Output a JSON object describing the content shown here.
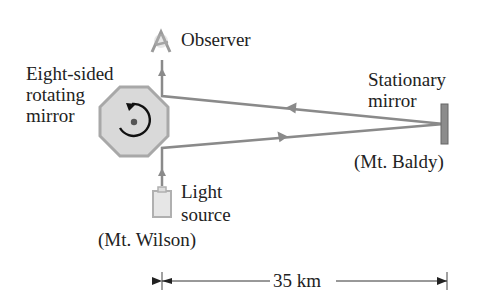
{
  "diagram": {
    "labels": {
      "observer": "Observer",
      "rotating_mirror_line1": "Eight-sided",
      "rotating_mirror_line2": "rotating",
      "rotating_mirror_line3": "mirror",
      "stationary_mirror_line1": "Stationary",
      "stationary_mirror_line2": "mirror",
      "stationary_location": "(Mt. Baldy)",
      "light_source_line1": "Light",
      "light_source_line2": "source",
      "source_location": "(Mt. Wilson)",
      "distance": "35 km"
    },
    "colors": {
      "beam": "#8a8a8a",
      "octagon_fill": "#d9d9d9",
      "octagon_stroke": "#a8a8a8",
      "mirror_fill": "#8c8c8c",
      "text": "#222222"
    }
  }
}
